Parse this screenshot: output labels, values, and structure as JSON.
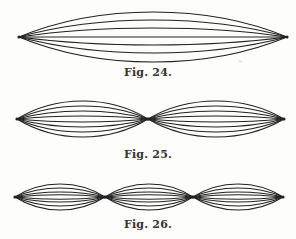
{
  "figures": [
    {
      "id": "fig24",
      "caption": "Fig. 24.",
      "caption_y": 66,
      "nodes_x": [
        19,
        287
      ],
      "center_y": 37,
      "amplitudes": [
        25,
        17,
        9,
        0,
        -8,
        -16,
        -25
      ]
    },
    {
      "id": "fig25",
      "caption": "Fig. 25.",
      "caption_y": 148,
      "nodes_x": [
        17,
        148,
        284
      ],
      "center_y": 119,
      "amplitudes": [
        18,
        13,
        8,
        3,
        -3,
        -8,
        -13,
        -18
      ]
    },
    {
      "id": "fig26",
      "caption": "Fig. 26.",
      "caption_y": 218,
      "nodes_x": [
        15,
        105,
        193,
        283
      ],
      "center_y": 197,
      "amplitudes": [
        13,
        9,
        5,
        2,
        -2,
        -5,
        -9,
        -13
      ]
    }
  ],
  "style": {
    "stroke": "#222222",
    "background": "#fdfdfb"
  },
  "marks": [
    {
      "text": "≈",
      "x": 238,
      "y": 58
    }
  ]
}
